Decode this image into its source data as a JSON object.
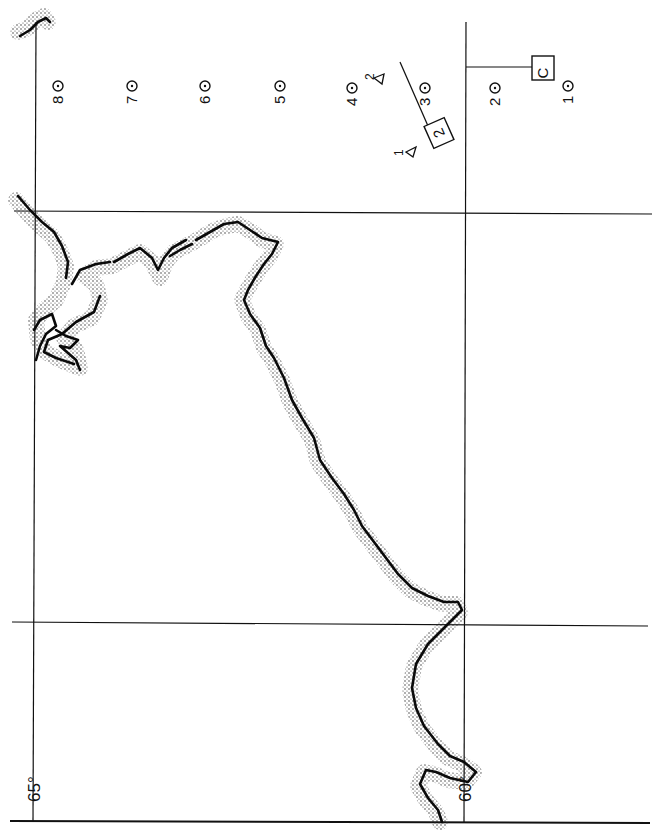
{
  "map": {
    "orientation": "rotated 90 degrees (page printed sideways)",
    "graticule_labels": {
      "lon_65": "65°",
      "lon_60": "60°"
    },
    "stations": [
      {
        "label": "8",
        "x": 58,
        "y": 95
      },
      {
        "label": "7",
        "x": 132,
        "y": 95
      },
      {
        "label": "6",
        "x": 205,
        "y": 95
      },
      {
        "label": "5",
        "x": 280,
        "y": 95
      },
      {
        "label": "4",
        "x": 352,
        "y": 95
      },
      {
        "label": "3",
        "x": 425,
        "y": 95
      },
      {
        "label": "2",
        "x": 495,
        "y": 95
      },
      {
        "label": "1",
        "x": 568,
        "y": 95
      }
    ],
    "markers": {
      "box_c": "C",
      "box_2": "2",
      "triangle_1": "1",
      "triangle_2": "2"
    },
    "colors": {
      "ink": "#111111",
      "paper": "#ffffff"
    }
  }
}
